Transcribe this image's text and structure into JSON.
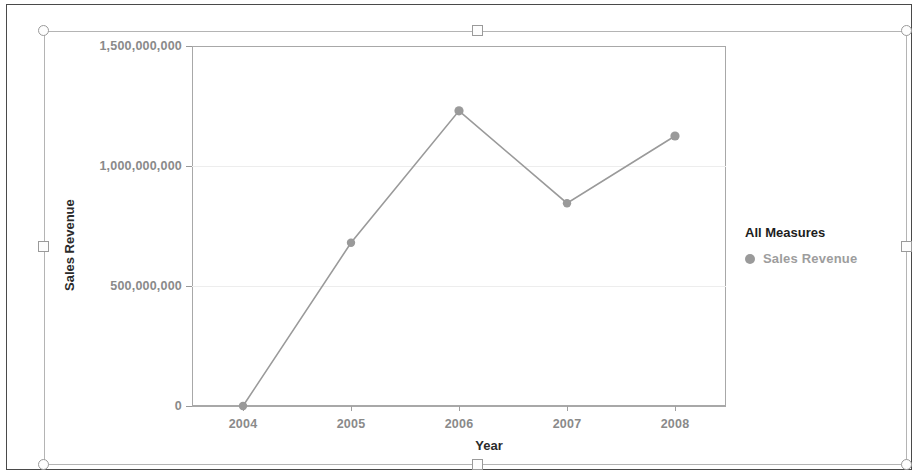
{
  "chart_data": {
    "type": "line",
    "title": "",
    "xlabel": "Year",
    "ylabel": "Sales Revenue",
    "categories": [
      "2004",
      "2005",
      "2006",
      "2007",
      "2008"
    ],
    "series": [
      {
        "name": "Sales Revenue",
        "values": [
          0,
          680000000,
          1230000000,
          845000000,
          1125000000
        ],
        "color": "#9a9a9a",
        "marker": "circle"
      }
    ],
    "ylim": [
      0,
      1500000000
    ],
    "ytick_labels": [
      "1,500,000,000",
      "1,000,000,000",
      "500,000,000",
      "0"
    ],
    "ytick_values": [
      1500000000,
      1000000000,
      500000000,
      0
    ],
    "xtick_labels": [
      "2004",
      "2005",
      "2006",
      "2007",
      "2008"
    ],
    "grid": true,
    "legend_position": "right",
    "legend": {
      "title": "All Measures",
      "entries": [
        "Sales Revenue"
      ]
    }
  },
  "legend": {
    "title": "All Measures",
    "entry_label": "Sales Revenue"
  },
  "axes": {
    "x_title": "Year",
    "y_title": "Sales Revenue"
  },
  "colors": {
    "series": "#9a9a9a",
    "gridline": "#ededed",
    "axis": "#a8a8a8",
    "tick_text": "#8a8a8a",
    "title_text": "#1d1d1d",
    "selection_border": "#b4b4b4",
    "page_border": "#4a4a4a"
  },
  "selection": {
    "handles": [
      "top-left",
      "top-middle",
      "top-right",
      "middle-left",
      "middle-right",
      "bottom-left",
      "bottom-middle",
      "bottom-right"
    ]
  }
}
